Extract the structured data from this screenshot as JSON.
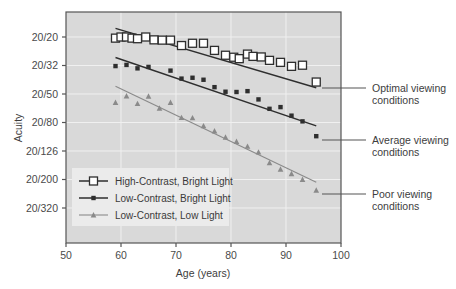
{
  "chart_data": {
    "type": "scatter",
    "title": "",
    "xlabel": "Age (years)",
    "ylabel": "Acuity",
    "xlim": [
      50,
      100
    ],
    "ylim_labels": [
      "20/20",
      "20/32",
      "20/50",
      "20/80",
      "20/126",
      "20/200",
      "20/320"
    ],
    "xticks": [
      50,
      60,
      70,
      80,
      90,
      100
    ],
    "xtick_labels": [
      "50",
      "60",
      "70",
      "80",
      "90",
      "100"
    ],
    "yticks": [
      "20/20",
      "20/32",
      "20/50",
      "20/80",
      "20/126",
      "20/200",
      "20/320"
    ],
    "grid": true,
    "legend_position": "lower-left",
    "plot_background": "#d9d9d9",
    "grid_color": "#f0f0f0",
    "axis_color": "#555555",
    "series": [
      {
        "name": "High-Contrast, Bright Light",
        "marker": "open-square",
        "color": "#2e2e2e",
        "fit_line": {
          "x0": 59.0,
          "y0": -0.3,
          "x1": 95.5,
          "y1": 1.78
        },
        "points": [
          {
            "x": 59.0,
            "y": 0.04
          },
          {
            "x": 60.0,
            "y": 0.0
          },
          {
            "x": 61.0,
            "y": 0.0
          },
          {
            "x": 62.0,
            "y": 0.04
          },
          {
            "x": 63.0,
            "y": 0.06
          },
          {
            "x": 64.5,
            "y": 0.0
          },
          {
            "x": 66.0,
            "y": 0.1
          },
          {
            "x": 67.5,
            "y": 0.11
          },
          {
            "x": 69.0,
            "y": 0.11
          },
          {
            "x": 71.0,
            "y": 0.3
          },
          {
            "x": 73.0,
            "y": 0.22
          },
          {
            "x": 75.0,
            "y": 0.22
          },
          {
            "x": 77.0,
            "y": 0.47
          },
          {
            "x": 79.0,
            "y": 0.64
          },
          {
            "x": 80.5,
            "y": 0.71
          },
          {
            "x": 81.5,
            "y": 0.76
          },
          {
            "x": 83.0,
            "y": 0.6
          },
          {
            "x": 84.0,
            "y": 0.68
          },
          {
            "x": 85.5,
            "y": 0.7
          },
          {
            "x": 87.0,
            "y": 0.82
          },
          {
            "x": 89.0,
            "y": 0.89
          },
          {
            "x": 91.0,
            "y": 1.03
          },
          {
            "x": 93.0,
            "y": 0.99
          },
          {
            "x": 95.5,
            "y": 1.58
          }
        ]
      },
      {
        "name": "Low-Contrast, Bright Light",
        "marker": "filled-square",
        "color": "#2e2e2e",
        "fit_line": {
          "x0": 59.0,
          "y0": 0.72,
          "x1": 95.5,
          "y1": 3.12
        },
        "points": [
          {
            "x": 59.0,
            "y": 1.02
          },
          {
            "x": 61.0,
            "y": 0.98
          },
          {
            "x": 63.0,
            "y": 1.1
          },
          {
            "x": 65.0,
            "y": 1.05
          },
          {
            "x": 69.0,
            "y": 1.18
          },
          {
            "x": 71.0,
            "y": 1.46
          },
          {
            "x": 73.0,
            "y": 1.43
          },
          {
            "x": 75.0,
            "y": 1.5
          },
          {
            "x": 77.0,
            "y": 1.76
          },
          {
            "x": 79.0,
            "y": 1.92
          },
          {
            "x": 81.0,
            "y": 1.93
          },
          {
            "x": 83.0,
            "y": 1.9
          },
          {
            "x": 85.0,
            "y": 2.19
          },
          {
            "x": 87.0,
            "y": 2.52
          },
          {
            "x": 89.0,
            "y": 2.46
          },
          {
            "x": 91.0,
            "y": 2.76
          },
          {
            "x": 93.0,
            "y": 2.96
          },
          {
            "x": 95.5,
            "y": 3.48
          }
        ]
      },
      {
        "name": "Low-Contrast, Low Light",
        "marker": "triangle",
        "color": "#8a8a8a",
        "fit_line": {
          "x0": 59.0,
          "y0": 1.73,
          "x1": 95.5,
          "y1": 5.1
        },
        "points": [
          {
            "x": 59.0,
            "y": 2.3
          },
          {
            "x": 61.0,
            "y": 2.07
          },
          {
            "x": 63.0,
            "y": 2.34
          },
          {
            "x": 65.0,
            "y": 2.08
          },
          {
            "x": 67.0,
            "y": 2.5
          },
          {
            "x": 69.0,
            "y": 2.3
          },
          {
            "x": 71.0,
            "y": 2.83
          },
          {
            "x": 73.0,
            "y": 2.84
          },
          {
            "x": 75.0,
            "y": 3.12
          },
          {
            "x": 77.0,
            "y": 3.3
          },
          {
            "x": 79.0,
            "y": 3.52
          },
          {
            "x": 81.0,
            "y": 3.67
          },
          {
            "x": 83.0,
            "y": 3.84
          },
          {
            "x": 85.0,
            "y": 4.04
          },
          {
            "x": 87.0,
            "y": 4.42
          },
          {
            "x": 89.0,
            "y": 4.64
          },
          {
            "x": 91.0,
            "y": 4.8
          },
          {
            "x": 93.0,
            "y": 5.0
          },
          {
            "x": 95.5,
            "y": 5.38
          }
        ]
      }
    ],
    "annotations": [
      {
        "id": "optimal",
        "text_line1": "Optimal viewing",
        "text_line2": "conditions"
      },
      {
        "id": "average",
        "text_line1": "Average viewing",
        "text_line2": "conditions"
      },
      {
        "id": "poor",
        "text_line1": "Poor viewing",
        "text_line2": "conditions"
      }
    ],
    "legend": [
      {
        "label": "High-Contrast, Bright Light",
        "marker": "open-square"
      },
      {
        "label": "Low-Contrast, Bright Light",
        "marker": "filled-square"
      },
      {
        "label": "Low-Contrast, Low Light",
        "marker": "triangle"
      }
    ]
  }
}
